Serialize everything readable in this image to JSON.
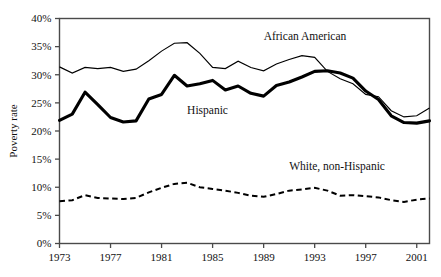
{
  "chart_data": {
    "type": "line",
    "title": "",
    "xlabel": "",
    "ylabel": "Poverty rate",
    "xlim": [
      1973,
      2002
    ],
    "ylim": [
      0,
      40
    ],
    "ytick_labels": [
      "0%",
      "5%",
      "10%",
      "15%",
      "20%",
      "25%",
      "30%",
      "35%",
      "40%"
    ],
    "ytick_values": [
      0,
      5,
      10,
      15,
      20,
      25,
      30,
      35,
      40
    ],
    "xtick_labels": [
      "1973",
      "1977",
      "1981",
      "1985",
      "1989",
      "1993",
      "1997",
      "2001"
    ],
    "xtick_values": [
      1973,
      1977,
      1981,
      1985,
      1989,
      1993,
      1997,
      2001
    ],
    "grid": false,
    "legend_position": "inline-annotations",
    "x": [
      1973,
      1974,
      1975,
      1976,
      1977,
      1978,
      1979,
      1980,
      1981,
      1982,
      1983,
      1984,
      1985,
      1986,
      1987,
      1988,
      1989,
      1990,
      1991,
      1992,
      1993,
      1994,
      1995,
      1996,
      1997,
      1998,
      1999,
      2000,
      2001,
      2002
    ],
    "series": [
      {
        "name": "African American",
        "style": "thin-solid",
        "color": "#000000",
        "label_x": 1989,
        "label_y": 36.2,
        "values": [
          31.4,
          30.3,
          31.3,
          31.1,
          31.3,
          30.6,
          31.0,
          32.5,
          34.2,
          35.6,
          35.7,
          33.8,
          31.3,
          31.1,
          32.4,
          31.3,
          30.7,
          31.9,
          32.7,
          33.4,
          33.1,
          30.6,
          29.3,
          28.4,
          26.5,
          26.1,
          23.6,
          22.5,
          22.7,
          24.1
        ]
      },
      {
        "name": "Hispanic",
        "style": "thick-solid",
        "color": "#000000",
        "label_x": 1983,
        "label_y": 23.0,
        "values": [
          21.9,
          23.0,
          26.9,
          24.7,
          22.4,
          21.6,
          21.8,
          25.7,
          26.5,
          29.9,
          28.0,
          28.4,
          29.0,
          27.3,
          28.0,
          26.7,
          26.2,
          28.1,
          28.7,
          29.6,
          30.6,
          30.7,
          30.3,
          29.4,
          27.1,
          25.6,
          22.7,
          21.5,
          21.4,
          21.8
        ]
      },
      {
        "name": "White, non-Hispanic",
        "style": "dashed",
        "color": "#000000",
        "label_x": 1991,
        "label_y": 13.1,
        "values": [
          7.5,
          7.7,
          8.6,
          8.1,
          8.0,
          7.9,
          8.1,
          9.1,
          9.9,
          10.6,
          10.8,
          10.0,
          9.7,
          9.4,
          9.0,
          8.5,
          8.3,
          8.8,
          9.4,
          9.6,
          9.9,
          9.4,
          8.5,
          8.6,
          8.4,
          8.2,
          7.7,
          7.4,
          7.8,
          8.0
        ]
      }
    ]
  },
  "axis": {
    "y_title": "Poverty rate"
  }
}
